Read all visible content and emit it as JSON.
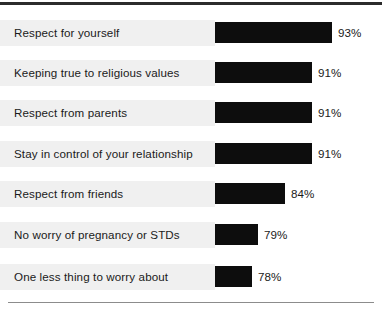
{
  "chart_data": {
    "type": "bar",
    "orientation": "horizontal",
    "title": "",
    "subtitle": "",
    "xlabel": "",
    "ylabel": "",
    "grid": false,
    "legend": null,
    "axis_note": "Bar lengths use a truncated (non-zero) baseline; value labels shown at bar ends.",
    "xlim": [
      71,
      93
    ],
    "categories": [
      "Respect for yourself",
      "Keeping true to religious values",
      "Respect from parents",
      "Stay in control of your relationship",
      "Respect from friends",
      "No worry of pregnancy or STDs",
      "One less thing to worry about"
    ],
    "values": [
      93,
      91,
      91,
      91,
      84,
      79,
      78
    ],
    "value_labels": [
      "93%",
      "91%",
      "91%",
      "91%",
      "84%",
      "79%",
      "78%"
    ],
    "bar_pixel_widths": [
      117,
      97,
      97,
      97,
      70,
      43,
      37
    ],
    "colors": {
      "bar": "#0d0d0d",
      "row_band": "#f0f0f0",
      "text": "#1a1a1a",
      "top_rule": "#2b2b2b",
      "bottom_rule": "#8c8c8c",
      "background": "#ffffff"
    }
  },
  "rows": [
    {
      "label": "Respect for yourself",
      "value_label": "93%",
      "bar_width": 117,
      "top": 20
    },
    {
      "label": "Keeping true to religious values",
      "value_label": "91%",
      "bar_width": 97,
      "top": 60
    },
    {
      "label": "Respect from parents",
      "value_label": "91%",
      "bar_width": 97,
      "top": 100
    },
    {
      "label": "Stay in control of your relationship",
      "value_label": "91%",
      "bar_width": 97,
      "top": 141
    },
    {
      "label": "Respect from friends",
      "value_label": "84%",
      "bar_width": 70,
      "top": 181
    },
    {
      "label": "No worry of pregnancy or STDs",
      "value_label": "79%",
      "bar_width": 43,
      "top": 222
    },
    {
      "label": "One less thing to worry about",
      "value_label": "78%",
      "bar_width": 37,
      "top": 264
    }
  ]
}
